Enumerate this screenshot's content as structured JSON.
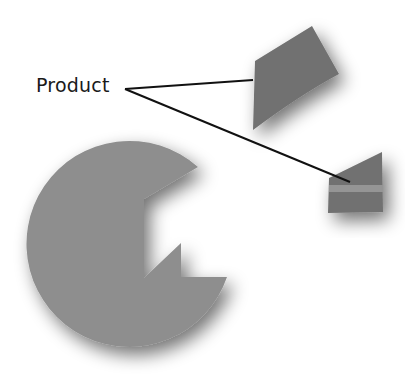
{
  "diagram": {
    "type": "exploded-pie-callout",
    "callout": {
      "label": "Product",
      "targets": [
        "upper-exploded-slice",
        "lower-exploded-slice"
      ]
    },
    "colors": {
      "background": "#ffffff",
      "pie_body": "#8e8e8e",
      "exploded_slice": "#717171",
      "slice_band": "#959595",
      "callout_line": "#111111",
      "label_text": "#1a1a1a"
    }
  }
}
